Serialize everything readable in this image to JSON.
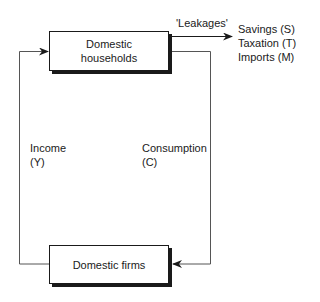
{
  "diagram": {
    "nodes": {
      "households": {
        "line1": "Domestic",
        "line2": "households"
      },
      "firms": {
        "label": "Domestic firms"
      }
    },
    "flows": {
      "income": {
        "line1": "Income",
        "line2": "(Y)"
      },
      "consumption": {
        "line1": "Consumption",
        "line2": "(C)"
      },
      "leakages_label": "'Leakages'"
    },
    "leakages": [
      "Savings (S)",
      "Taxation (T)",
      "Imports (M)"
    ]
  }
}
